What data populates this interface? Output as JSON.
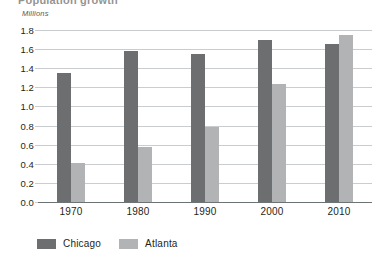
{
  "figure": {
    "clipped_title": "Population growth",
    "axis_unit_label": "Millions"
  },
  "chart_data": {
    "type": "bar",
    "title": "",
    "xlabel": "",
    "ylabel": "Millions",
    "ylim": [
      0.0,
      1.8
    ],
    "ytick_step": 0.2,
    "grid": true,
    "legend_position": "bottom-left",
    "categories": [
      "1970",
      "1980",
      "1990",
      "2000",
      "2010"
    ],
    "ytick_labels": [
      "0.0",
      "0.2",
      "0.4",
      "0.6",
      "0.8",
      "1.0",
      "1.2",
      "1.4",
      "1.6",
      "1.8"
    ],
    "series": [
      {
        "name": "Chicago",
        "color": "#6d6e70",
        "values": [
          1.35,
          1.58,
          1.55,
          1.7,
          1.65
        ]
      },
      {
        "name": "Atlanta",
        "color": "#b1b3b5",
        "values": [
          0.41,
          0.58,
          0.79,
          1.23,
          1.75
        ]
      }
    ]
  }
}
